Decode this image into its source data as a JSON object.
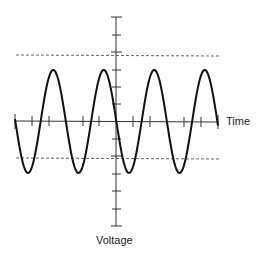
{
  "diagram": {
    "type": "sine-wave-plot",
    "x_axis_label": "Time",
    "y_axis_label": "Voltage",
    "cycles_shown": 4,
    "amplitude_lines": "dashed",
    "line_color": "#111111",
    "dash_color": "#555555"
  }
}
